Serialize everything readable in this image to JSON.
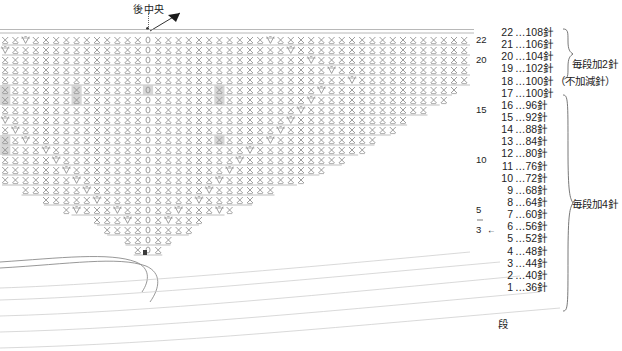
{
  "chart": {
    "title_marker": "後中央",
    "bottom_axis_label": "段",
    "arrow_icon": "arrow-pointer",
    "grid_row_numbers": [
      {
        "row": 22,
        "y": 44
      },
      {
        "row": 20,
        "y": 64
      },
      {
        "row": 15,
        "y": 114
      },
      {
        "row": 10,
        "y": 164
      },
      {
        "row": 5,
        "y": 214
      },
      {
        "row": 3,
        "y": 244
      }
    ],
    "row3_arrow": "←",
    "symbols": {
      "single_crochet": "×",
      "increase": "V",
      "chain": "0"
    },
    "center_column_text": "×0×",
    "total_rows": 22,
    "highlight_color": "#d0d0d0",
    "line_color": "#9a9a9a",
    "symbol_color": "#8c8c8c"
  },
  "legend": {
    "unit": "針",
    "separator": "…",
    "rows": [
      {
        "row": "22",
        "count": "108",
        "note": ""
      },
      {
        "row": "21",
        "count": "106",
        "note": ""
      },
      {
        "row": "20",
        "count": "104",
        "note": ""
      },
      {
        "row": "19",
        "count": "102",
        "note": ""
      },
      {
        "row": "18",
        "count": "100",
        "note": "（不加減針）"
      },
      {
        "row": "17",
        "count": "100",
        "note": ""
      },
      {
        "row": "16",
        "count": "96",
        "note": ""
      },
      {
        "row": "15",
        "count": "92",
        "note": ""
      },
      {
        "row": "14",
        "count": "88",
        "note": ""
      },
      {
        "row": "13",
        "count": "84",
        "note": ""
      },
      {
        "row": "12",
        "count": "80",
        "note": ""
      },
      {
        "row": "11",
        "count": "76",
        "note": ""
      },
      {
        "row": "10",
        "count": "72",
        "note": ""
      },
      {
        "row": "9",
        "count": "68",
        "note": ""
      },
      {
        "row": "8",
        "count": "64",
        "note": ""
      },
      {
        "row": "7",
        "count": "60",
        "note": ""
      },
      {
        "row": "6",
        "count": "56",
        "note": ""
      },
      {
        "row": "5",
        "count": "52",
        "note": ""
      },
      {
        "row": "4",
        "count": "48",
        "note": ""
      },
      {
        "row": "3",
        "count": "44",
        "note": ""
      },
      {
        "row": "2",
        "count": "40",
        "note": ""
      },
      {
        "row": "1",
        "count": "36",
        "note": ""
      }
    ],
    "brace_1_label": "毎段加2針",
    "brace_2_label": "毎段加4針",
    "row_axis_label": "段"
  },
  "chart_data": {
    "type": "table",
    "categories": [
      "1",
      "2",
      "3",
      "4",
      "5",
      "6",
      "7",
      "8",
      "9",
      "10",
      "11",
      "12",
      "13",
      "14",
      "15",
      "16",
      "17",
      "18",
      "19",
      "20",
      "21",
      "22"
    ],
    "values": [
      36,
      40,
      44,
      48,
      52,
      56,
      60,
      64,
      68,
      72,
      76,
      80,
      84,
      88,
      92,
      96,
      100,
      100,
      102,
      104,
      106,
      108
    ],
    "xlabel": "段",
    "ylabel": "針",
    "series": [
      {
        "name": "stitch_count",
        "values": [
          36,
          40,
          44,
          48,
          52,
          56,
          60,
          64,
          68,
          72,
          76,
          80,
          84,
          88,
          92,
          96,
          100,
          100,
          102,
          104,
          106,
          108
        ]
      },
      {
        "name": "increase_per_row",
        "values": [
          0,
          4,
          4,
          4,
          4,
          4,
          4,
          4,
          4,
          4,
          4,
          4,
          4,
          4,
          4,
          4,
          4,
          0,
          2,
          2,
          2,
          2
        ]
      }
    ],
    "annotations": [
      {
        "text": "毎段加4針",
        "rows": "1-17"
      },
      {
        "text": "不加減針",
        "rows": "18"
      },
      {
        "text": "毎段加2針",
        "rows": "19-22"
      }
    ],
    "grid": true,
    "legend_position": "right"
  }
}
